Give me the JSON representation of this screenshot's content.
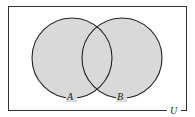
{
  "diagram": {
    "type": "venn",
    "universe": {
      "label": "U"
    },
    "sets": [
      {
        "label": "A"
      },
      {
        "label": "B"
      }
    ],
    "shaded_region": "A ∪ B",
    "colors": {
      "fill": "#d9d9d9",
      "stroke": "#222222",
      "background": "#ffffff"
    }
  }
}
